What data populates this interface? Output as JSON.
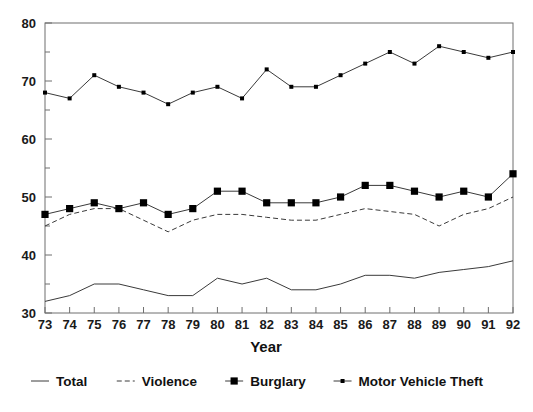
{
  "chart_data": {
    "type": "line",
    "title": "",
    "xlabel": "Year",
    "ylabel": "",
    "x": [
      73,
      74,
      75,
      76,
      77,
      78,
      79,
      80,
      81,
      82,
      83,
      84,
      85,
      86,
      87,
      88,
      89,
      90,
      91,
      92
    ],
    "categories": [
      "73",
      "74",
      "75",
      "76",
      "77",
      "78",
      "79",
      "80",
      "81",
      "82",
      "83",
      "84",
      "85",
      "86",
      "87",
      "88",
      "89",
      "90",
      "91",
      "92"
    ],
    "xlim": [
      73,
      92
    ],
    "ylim": [
      30,
      80
    ],
    "yticks": [
      30,
      40,
      50,
      60,
      70,
      80
    ],
    "ytick_labels": [
      "30",
      "40",
      "50",
      "60",
      "70",
      "80"
    ],
    "yminor_step": 5,
    "grid": false,
    "legend_position": "bottom",
    "series": [
      {
        "name": "Total",
        "style": "solid",
        "marker": "none",
        "values": [
          32,
          33,
          35,
          35,
          34,
          33,
          33,
          36,
          35,
          36,
          34,
          34,
          35,
          36.5,
          36.5,
          36,
          37,
          37.5,
          38,
          39
        ]
      },
      {
        "name": "Violence",
        "style": "dashed",
        "marker": "none",
        "values": [
          45,
          47,
          48,
          48,
          46,
          44,
          46,
          47,
          47,
          46.5,
          46,
          46,
          47,
          48,
          47.5,
          47,
          45,
          47,
          48,
          50
        ]
      },
      {
        "name": "Burglary",
        "style": "solid",
        "marker": "square",
        "values": [
          47,
          48,
          49,
          48,
          49,
          47,
          48,
          51,
          51,
          49,
          49,
          49,
          50,
          52,
          52,
          51,
          50,
          51,
          50,
          54
        ]
      },
      {
        "name": "Motor Vehicle Theft",
        "style": "solid",
        "marker": "dot",
        "values": [
          68,
          67,
          71,
          69,
          68,
          66,
          68,
          69,
          67,
          72,
          69,
          69,
          71,
          73,
          75,
          73,
          76,
          75,
          74,
          75
        ]
      }
    ]
  },
  "legend": {
    "items": [
      {
        "label": "Total",
        "swatch": "solid-line"
      },
      {
        "label": "Violence",
        "swatch": "dashed-line"
      },
      {
        "label": "Burglary",
        "swatch": "square-marker"
      },
      {
        "label": "Motor Vehicle Theft",
        "swatch": "dot-marker"
      }
    ]
  },
  "colors": {
    "line": "#3a3a3a",
    "marker": "#000000",
    "frame": "#6e6e6e",
    "text": "#111111",
    "background": "#ffffff"
  }
}
